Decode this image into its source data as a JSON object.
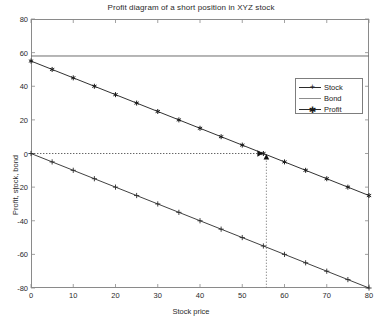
{
  "chart_data": {
    "type": "line",
    "title": "Profit diagram of a short position in XYZ stock",
    "xlabel": "Stock price",
    "ylabel": "Profit, stock, bond",
    "xlim": [
      0,
      80
    ],
    "ylim": [
      -80,
      80
    ],
    "xticks": [
      0,
      10,
      20,
      30,
      40,
      50,
      60,
      70,
      80
    ],
    "yticks": [
      -80,
      -60,
      -40,
      -20,
      0,
      20,
      40,
      60,
      80
    ],
    "grid": false,
    "legend_position": "upper right",
    "series": [
      {
        "name": "Stock",
        "marker": "+",
        "color": "#2b2b2b",
        "x": [
          0,
          5,
          10,
          15,
          20,
          25,
          30,
          35,
          40,
          45,
          50,
          55,
          60,
          65,
          70,
          75,
          80
        ],
        "values": [
          0,
          -5,
          -10,
          -15,
          -20,
          -25,
          -30,
          -35,
          -40,
          -45,
          -50,
          -55,
          -60,
          -65,
          -70,
          -75,
          -80
        ]
      },
      {
        "name": "Bond",
        "marker": "none",
        "color": "#6e6e6e",
        "x": [
          0,
          80
        ],
        "values": [
          58,
          58
        ]
      },
      {
        "name": "Profit",
        "marker": "*",
        "color": "#1a1a1a",
        "x": [
          0,
          5,
          10,
          15,
          20,
          25,
          30,
          35,
          40,
          45,
          50,
          55,
          60,
          65,
          70,
          75,
          80
        ],
        "values": [
          55,
          50,
          45,
          40,
          35,
          30,
          25,
          20,
          15,
          10,
          5,
          0,
          -5,
          -10,
          -15,
          -20,
          -25
        ]
      }
    ],
    "annotations": [
      {
        "name": "zero-profit-guide-horizontal",
        "type": "dotted-line",
        "from": [
          0,
          0
        ],
        "to": [
          55,
          0
        ],
        "arrow": "right"
      },
      {
        "name": "breakeven-guide-vertical",
        "type": "dotted-line",
        "from": [
          55,
          -80
        ],
        "to": [
          55,
          0
        ],
        "arrow": "up"
      },
      {
        "name": "breakeven-price",
        "value": 55
      }
    ]
  },
  "legend": {
    "entries": [
      {
        "label": "Stock",
        "marker": "+"
      },
      {
        "label": "Bond",
        "marker": ""
      },
      {
        "label": "Profit",
        "marker": "*"
      }
    ]
  },
  "axis": {
    "x_tick_labels": [
      "0",
      "10",
      "20",
      "30",
      "40",
      "50",
      "60",
      "70",
      "80"
    ],
    "y_tick_labels": [
      "80",
      "60",
      "40",
      "20",
      "0",
      "-20",
      "-40",
      "-60",
      "-80"
    ]
  },
  "colors": {
    "axis": "#8a8a8a",
    "stock": "#2b2b2b",
    "bond": "#6e6e6e",
    "profit": "#1a1a1a",
    "text": "#2a2a2a"
  }
}
